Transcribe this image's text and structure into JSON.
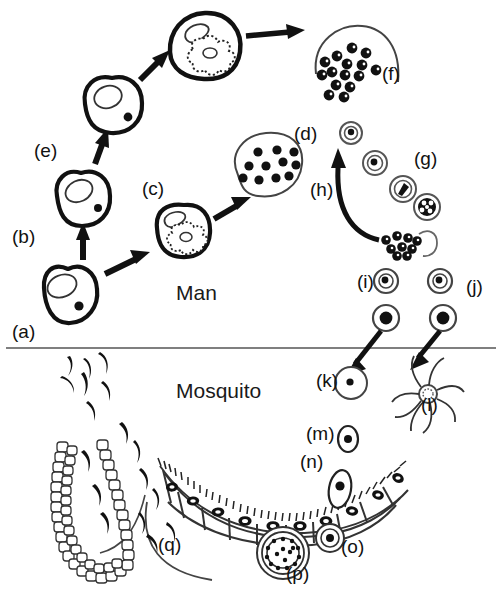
{
  "figure": {
    "hosts": [
      {
        "id": "man",
        "label": "Man",
        "x": 176,
        "y": 300
      },
      {
        "id": "mosquito",
        "label": "Mosquito",
        "x": 176,
        "y": 398
      }
    ],
    "divider": {
      "y": 348,
      "x1": 6,
      "x2": 496,
      "color": "#555555"
    },
    "stages": [
      {
        "key": "a",
        "label": "(a)",
        "x": 12,
        "y": 338,
        "name": "infected-liver-cell-a"
      },
      {
        "key": "b",
        "label": "(b)",
        "x": 12,
        "y": 243,
        "name": "liver-cell-b"
      },
      {
        "key": "c",
        "label": "(c)",
        "x": 142,
        "y": 195,
        "name": "schizont-liver-cell-c"
      },
      {
        "key": "d",
        "label": "(d)",
        "x": 294,
        "y": 140,
        "name": "merozoites-released-d"
      },
      {
        "key": "e",
        "label": "(e)",
        "x": 34,
        "y": 157,
        "name": "liver-cell-e"
      },
      {
        "key": "f",
        "label": "(f)",
        "x": 382,
        "y": 80,
        "name": "merozoites-burst-f"
      },
      {
        "key": "g",
        "label": "(g)",
        "x": 414,
        "y": 165,
        "name": "erythrocytic-cycle-g"
      },
      {
        "key": "h",
        "label": "(h)",
        "x": 310,
        "y": 196,
        "name": "reinvasion-arrow-h"
      },
      {
        "key": "i",
        "label": "(i)",
        "x": 357,
        "y": 288,
        "name": "macrogametocyte-i"
      },
      {
        "key": "j",
        "label": "(j)",
        "x": 466,
        "y": 293,
        "name": "microgametocyte-j"
      },
      {
        "key": "k",
        "label": "(k)",
        "x": 316,
        "y": 387,
        "name": "macrogamete-k"
      },
      {
        "key": "l",
        "label": "(l)",
        "x": 421,
        "y": 411,
        "name": "exflagellating-microgamete-l"
      },
      {
        "key": "m",
        "label": "(m)",
        "x": 306,
        "y": 440,
        "name": "ookinete-m"
      },
      {
        "key": "n",
        "label": "(n)",
        "x": 300,
        "y": 468,
        "name": "gut-epithelium-n"
      },
      {
        "key": "o",
        "label": "(o)",
        "x": 341,
        "y": 553,
        "name": "young-oocyst-o"
      },
      {
        "key": "p",
        "label": "(p)",
        "x": 286,
        "y": 580,
        "name": "mature-oocyst-p"
      },
      {
        "key": "q",
        "label": "(q)",
        "x": 158,
        "y": 551,
        "name": "salivary-gland-sporozoites-q"
      }
    ],
    "cells": {
      "liver_a": {
        "cx": 68,
        "cy": 296,
        "rx": 30,
        "ry": 27
      },
      "liver_b": {
        "cx": 83,
        "cy": 199,
        "rx": 28,
        "ry": 26
      },
      "liver_e": {
        "cx": 113,
        "cy": 104,
        "rx": 29,
        "ry": 27
      },
      "schizont_c": {
        "cx": 183,
        "cy": 231,
        "rx": 27,
        "ry": 26
      },
      "schizont_top": {
        "cx": 205,
        "cy": 45,
        "rx": 33,
        "ry": 31
      }
    },
    "merozoite_clusters": {
      "d_count": 11,
      "f_count": 15,
      "h_count": 9
    },
    "g_series": [
      {
        "stage": "ring",
        "cx": 351,
        "cy": 133,
        "r": 11
      },
      {
        "stage": "trophozoite",
        "cx": 375,
        "cy": 163,
        "r": 12
      },
      {
        "stage": "late-troph",
        "cx": 403,
        "cy": 189,
        "r": 13
      },
      {
        "stage": "schizont",
        "cx": 427,
        "cy": 207,
        "r": 13
      }
    ],
    "gametocytes": [
      {
        "id": "i-upper",
        "cx": 386,
        "cy": 281,
        "r": 12
      },
      {
        "id": "j-upper",
        "cx": 440,
        "cy": 281,
        "r": 12
      },
      {
        "id": "i-lower",
        "cx": 386,
        "cy": 318,
        "r": 13
      },
      {
        "id": "j-lower",
        "cx": 443,
        "cy": 318,
        "r": 13
      }
    ],
    "gut": {
      "cell_count": 9,
      "arc_cx": 278,
      "arc_cy": 370,
      "arc_r": 158
    },
    "oocysts": {
      "young": {
        "cx": 330,
        "cy": 538,
        "r": 14
      },
      "mature": {
        "cx": 283,
        "cy": 553,
        "r": 26,
        "sporozoite_dots": 16
      }
    },
    "salivary_gland": {
      "beads": 78,
      "label": "salivary gland"
    },
    "colors": {
      "ink": "#111111",
      "thin": "#3b3b3b",
      "divider": "#555555",
      "fill": "#ffffff"
    }
  }
}
